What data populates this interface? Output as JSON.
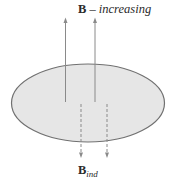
{
  "diagram": {
    "title_label": {
      "symbol": "B",
      "dash": " – ",
      "text": "increasing"
    },
    "induced_label": {
      "symbol": "B",
      "subscript": "ind"
    },
    "loop": {
      "shape": "ellipse",
      "fill": "#e6e6e6",
      "stroke": "#6e6e6e"
    },
    "external_field_arrows": {
      "count": 2,
      "direction": "up",
      "style": "solid",
      "color": "#8a8a8a"
    },
    "induced_field_arrows": {
      "count": 2,
      "direction": "down",
      "style": "dashed",
      "color": "#8a8a8a"
    }
  }
}
